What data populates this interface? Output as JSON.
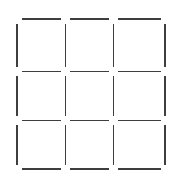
{
  "figure": {
    "canvas": {
      "width": 181,
      "height": 182,
      "background_color": "#ffffff"
    },
    "style": {
      "stroke_color": "#3e3e3e",
      "stroke_width": 1.6,
      "stroke_linecap": "butt",
      "gap": 9
    },
    "grid": {
      "rows": 3,
      "columns": 3,
      "cells": 9,
      "vertical_line_x": [
        17,
        65.3,
        113.6,
        165
      ],
      "horizontal_line_y": [
        19,
        71.3,
        120.6,
        169
      ]
    },
    "segments": {
      "horizontal": [
        {
          "name": "h-r0-c0",
          "y": 19,
          "x1": 21.5,
          "x2": 60.8
        },
        {
          "name": "h-r0-c1",
          "y": 19,
          "x1": 69.8,
          "x2": 109.1
        },
        {
          "name": "h-r0-c2",
          "y": 19,
          "x1": 118.1,
          "x2": 160.5
        },
        {
          "name": "h-r1-c0",
          "y": 71.3,
          "x1": 21.5,
          "x2": 60.8
        },
        {
          "name": "h-r1-c1",
          "y": 71.3,
          "x1": 69.8,
          "x2": 109.1
        },
        {
          "name": "h-r1-c2",
          "y": 71.3,
          "x1": 118.1,
          "x2": 160.5
        },
        {
          "name": "h-r2-c0",
          "y": 120.6,
          "x1": 21.5,
          "x2": 60.8
        },
        {
          "name": "h-r2-c1",
          "y": 120.6,
          "x1": 69.8,
          "x2": 109.1
        },
        {
          "name": "h-r2-c2",
          "y": 120.6,
          "x1": 118.1,
          "x2": 160.5
        },
        {
          "name": "h-r3-c0",
          "y": 169,
          "x1": 21.5,
          "x2": 60.8
        },
        {
          "name": "h-r3-c1",
          "y": 169,
          "x1": 69.8,
          "x2": 109.1
        },
        {
          "name": "h-r3-c2",
          "y": 169,
          "x1": 118.1,
          "x2": 160.5
        }
      ],
      "vertical": [
        {
          "name": "v-c0-r0",
          "x": 17,
          "y1": 23.5,
          "y2": 66.8
        },
        {
          "name": "v-c0-r1",
          "x": 17,
          "y1": 75.8,
          "y2": 116.1
        },
        {
          "name": "v-c0-r2",
          "x": 17,
          "y1": 125.1,
          "y2": 164.5
        },
        {
          "name": "v-c1-r0",
          "x": 65.3,
          "y1": 23.5,
          "y2": 66.8
        },
        {
          "name": "v-c1-r1",
          "x": 65.3,
          "y1": 75.8,
          "y2": 116.1
        },
        {
          "name": "v-c1-r2",
          "x": 65.3,
          "y1": 125.1,
          "y2": 164.5
        },
        {
          "name": "v-c2-r0",
          "x": 113.6,
          "y1": 23.5,
          "y2": 66.8
        },
        {
          "name": "v-c2-r1",
          "x": 113.6,
          "y1": 75.8,
          "y2": 116.1
        },
        {
          "name": "v-c2-r2",
          "x": 113.6,
          "y1": 125.1,
          "y2": 164.5
        },
        {
          "name": "v-c3-r0",
          "x": 165,
          "y1": 23.5,
          "y2": 66.8
        },
        {
          "name": "v-c3-r1",
          "x": 165,
          "y1": 75.8,
          "y2": 116.1
        },
        {
          "name": "v-c3-r2",
          "x": 165,
          "y1": 125.1,
          "y2": 164.5
        }
      ]
    }
  }
}
